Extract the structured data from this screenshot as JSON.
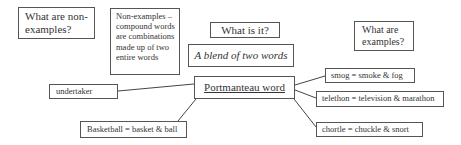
{
  "diagram": {
    "type": "concept-map",
    "center": {
      "label": "Portmanteau word"
    },
    "questions": {
      "what_is_it": "What is it?",
      "what_are_examples": "What are examples?",
      "what_are_non_examples": "What are non-examples?"
    },
    "definition": "A blend of two words",
    "non_examples_note": "Non-examples – compound words are combinations made up of two entire words",
    "non_examples": [
      {
        "label": "undertaker"
      },
      {
        "label": "Basketball = basket & ball"
      }
    ],
    "examples": [
      {
        "label": "smog = smoke & fog"
      },
      {
        "label": "telethon = television & marathon"
      },
      {
        "label": "chortle = chuckle & snort"
      }
    ],
    "colors": {
      "border": "#555555",
      "connector": "#444444",
      "text": "#333333",
      "background": "#ffffff"
    }
  }
}
